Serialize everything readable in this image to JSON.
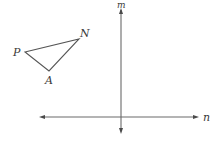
{
  "diagram": {
    "type": "geometry-transformation",
    "axes": [
      {
        "id": "m",
        "label": "m",
        "orientation": "vertical",
        "arrows": "both"
      },
      {
        "id": "n",
        "label": "n",
        "orientation": "horizontal",
        "arrows": "both"
      }
    ],
    "triangle": {
      "name": "PNA",
      "vertices": [
        {
          "id": "P",
          "label": "P"
        },
        {
          "id": "N",
          "label": "N"
        },
        {
          "id": "A",
          "label": "A"
        }
      ]
    },
    "colors": {
      "line": "#555555",
      "axis": "#6a6a6a",
      "text": "#3a3a3a",
      "background": "#ffffff"
    }
  }
}
